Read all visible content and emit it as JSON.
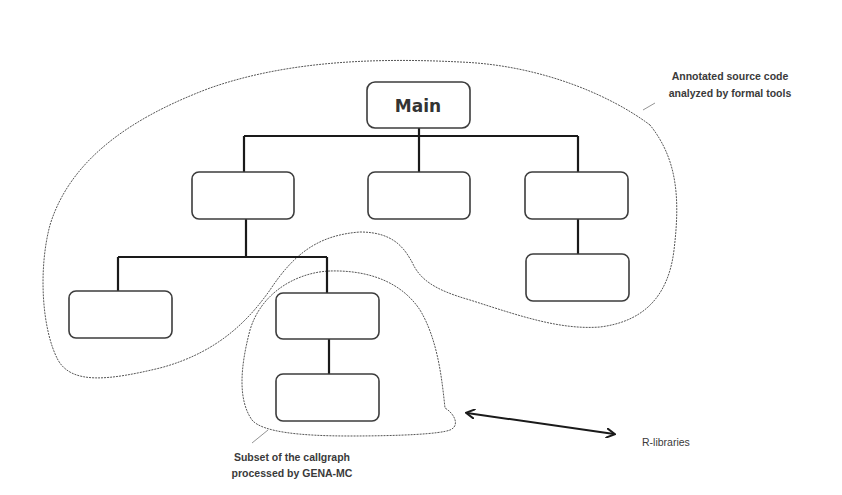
{
  "diagram": {
    "type": "callgraph",
    "nodes": [
      {
        "id": "main",
        "label": "Main",
        "level": 0
      },
      {
        "id": "n1",
        "label": "",
        "level": 1,
        "parent": "main"
      },
      {
        "id": "n2",
        "label": "",
        "level": 1,
        "parent": "main"
      },
      {
        "id": "n3",
        "label": "",
        "level": 1,
        "parent": "main"
      },
      {
        "id": "n4",
        "label": "",
        "level": 2,
        "parent": "n3"
      },
      {
        "id": "n5",
        "label": "",
        "level": 2,
        "parent": "n1"
      },
      {
        "id": "n6",
        "label": "",
        "level": 2,
        "parent": "n1"
      },
      {
        "id": "n7",
        "label": "",
        "level": 3,
        "parent": "n6"
      }
    ],
    "main_label": "Main",
    "annotations": {
      "outer_region_line1": "Annotated source code",
      "outer_region_line2": "analyzed by formal tools",
      "inner_region_line1": "Subset of the callgraph",
      "inner_region_line2": "processed by GENA-MC",
      "external_label": "R-libraries"
    },
    "colors": {
      "line": "#1a1a1a",
      "box_stroke": "#3c3c3c",
      "dashed_outline": "#555555",
      "text": "#333333"
    }
  }
}
